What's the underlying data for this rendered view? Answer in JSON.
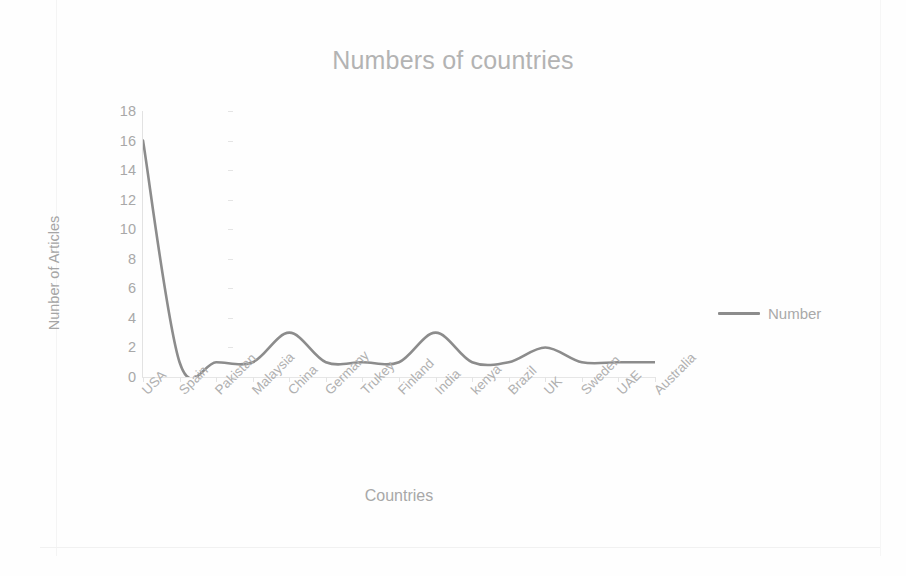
{
  "chart_data": {
    "type": "line",
    "title": "Numbers of countries",
    "xlabel": "Countries",
    "ylabel": "Nunber of Articles",
    "categories": [
      "USA",
      "Spain",
      "Pakistan",
      "Malaysia",
      "China",
      "Germany",
      "Trukey",
      "Finland",
      "India",
      "kenya",
      "Brazil",
      "UK",
      "Sweden",
      "UAE",
      "Australia"
    ],
    "series": [
      {
        "name": "Number",
        "values": [
          16,
          1,
          1,
          1,
          3,
          1,
          1,
          1,
          3,
          1,
          1,
          2,
          1,
          1,
          1
        ],
        "color": "#8c8c8c",
        "smooth": true
      }
    ],
    "ylim": [
      0,
      18
    ],
    "ytick_step": 2,
    "yticks": [
      "18",
      "16",
      "14",
      "12",
      "10",
      "8",
      "6",
      "4",
      "2",
      "0"
    ],
    "grid": false,
    "legend_position": "right",
    "legend_entries": [
      "Number"
    ]
  },
  "styling": {
    "title_color": "#b3b3b3",
    "axis_label_color": "#a8a8a8",
    "tick_color": "#a8a8a8",
    "line_color": "#8c8c8c",
    "background": "#ffffff"
  }
}
